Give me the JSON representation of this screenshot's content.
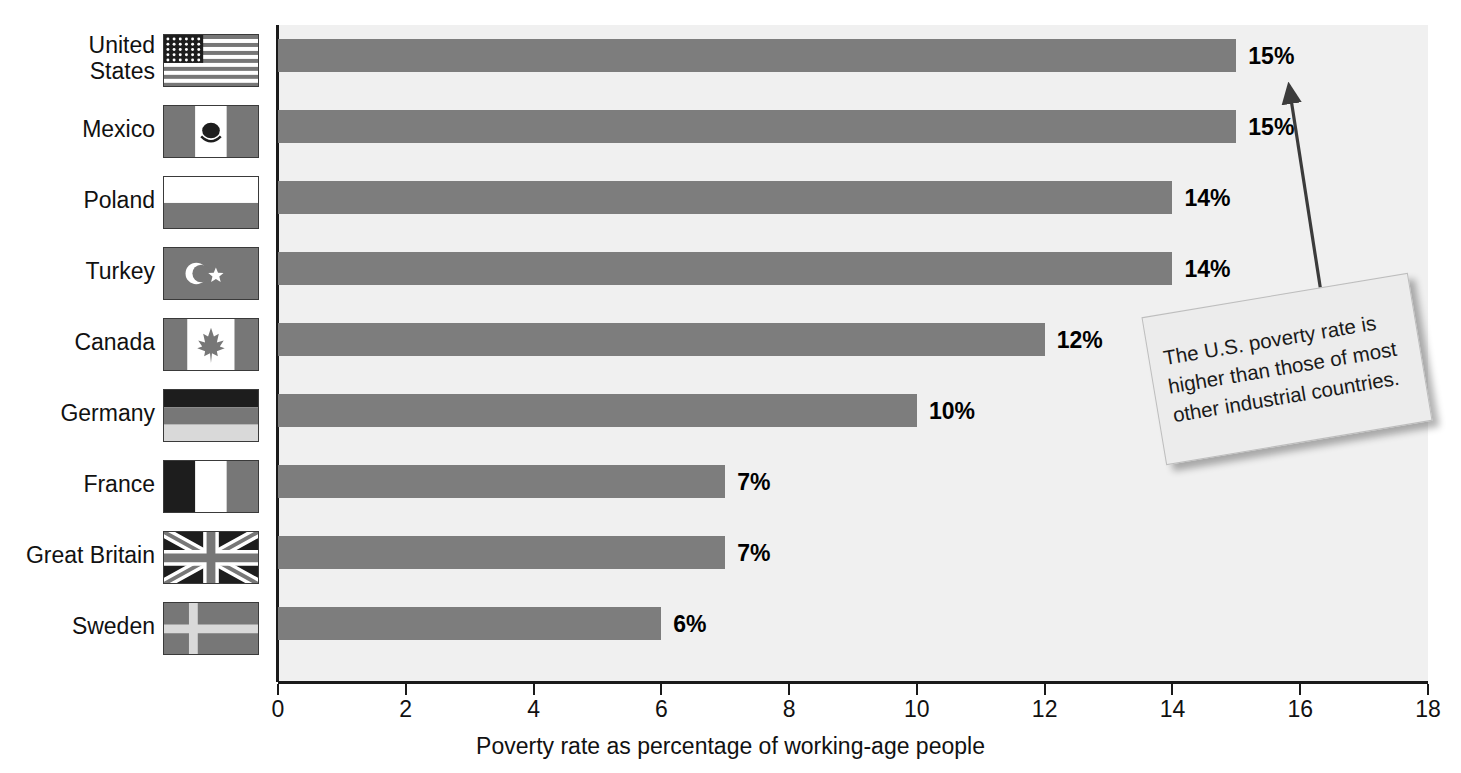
{
  "chart_data": {
    "type": "bar",
    "orientation": "horizontal",
    "title": "",
    "subtitle": "",
    "xlabel": "Poverty rate as percentage of working-age people",
    "ylabel": "",
    "xlim": [
      0,
      18
    ],
    "xticks": [
      0,
      2,
      4,
      6,
      8,
      10,
      12,
      14,
      16,
      18
    ],
    "xtick_labels": [
      "0",
      "2",
      "4",
      "6",
      "8",
      "10",
      "12",
      "14",
      "16",
      "18"
    ],
    "grid": false,
    "legend": null,
    "bar_color": "#7d7d7d",
    "plot_background": "#f0f0f0",
    "categories": [
      "United States",
      "Mexico",
      "Poland",
      "Turkey",
      "Canada",
      "Germany",
      "France",
      "Great Britain",
      "Sweden"
    ],
    "values": [
      15,
      15,
      14,
      14,
      12,
      10,
      7,
      7,
      6
    ],
    "value_labels": [
      "15%",
      "15%",
      "14%",
      "14%",
      "12%",
      "10%",
      "7%",
      "7%",
      "6%"
    ],
    "annotations": [
      {
        "name": "callout-note",
        "text": "The U.S. poverty rate is higher than those of most other industrial countries.",
        "lines": [
          "The U.S. poverty rate is",
          "higher than those of most",
          "other industrial countries."
        ],
        "points_to": "United States"
      }
    ]
  },
  "rows": [
    {
      "label_lines": [
        "United",
        "States"
      ],
      "flag": "flag-united-states",
      "value": 15,
      "value_label": "15%"
    },
    {
      "label_lines": [
        "Mexico"
      ],
      "flag": "flag-mexico",
      "value": 15,
      "value_label": "15%"
    },
    {
      "label_lines": [
        "Poland"
      ],
      "flag": "flag-poland",
      "value": 14,
      "value_label": "14%"
    },
    {
      "label_lines": [
        "Turkey"
      ],
      "flag": "flag-turkey",
      "value": 14,
      "value_label": "14%"
    },
    {
      "label_lines": [
        "Canada"
      ],
      "flag": "flag-canada",
      "value": 12,
      "value_label": "12%"
    },
    {
      "label_lines": [
        "Germany"
      ],
      "flag": "flag-germany",
      "value": 10,
      "value_label": "10%"
    },
    {
      "label_lines": [
        "France"
      ],
      "flag": "flag-france",
      "value": 7,
      "value_label": "7%"
    },
    {
      "label_lines": [
        "Great Britain"
      ],
      "flag": "flag-great-britain",
      "value": 7,
      "value_label": "7%"
    },
    {
      "label_lines": [
        "Sweden"
      ],
      "flag": "flag-sweden",
      "value": 6,
      "value_label": "6%"
    }
  ],
  "axis": {
    "title": "Poverty rate as percentage of working-age people",
    "ticks": [
      "0",
      "2",
      "4",
      "6",
      "8",
      "10",
      "12",
      "14",
      "16",
      "18"
    ]
  },
  "callout": {
    "line1": "The U.S. poverty rate is",
    "line2": "higher than those of most",
    "line3": "other industrial countries."
  },
  "colors": {
    "bar": "#7d7d7d",
    "plot_bg": "#f0f0f0",
    "axis": "#1a1a1a",
    "text": "#111111"
  }
}
